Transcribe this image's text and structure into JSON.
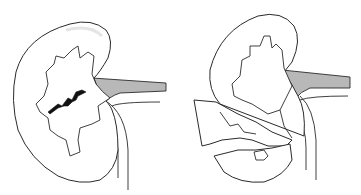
{
  "figure": {
    "panels": [
      {
        "id": "left",
        "label": "kidney with parenchymal laceration"
      },
      {
        "id": "right",
        "label": "kidney with fractured lower pole"
      }
    ],
    "colors": {
      "outline": "#2a2a2a",
      "vessel": "#b8b8b8",
      "crack": "#111111",
      "background": "#ffffff"
    }
  }
}
